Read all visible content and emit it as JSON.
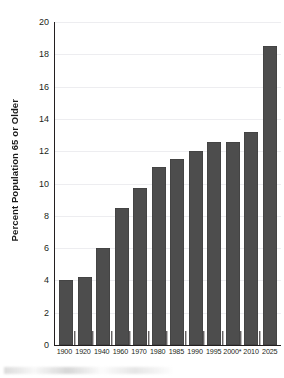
{
  "chart_data": {
    "type": "bar",
    "title": "",
    "xlabel": "",
    "ylabel": "Percent Population 65 or Older",
    "ylim": [
      0,
      20
    ],
    "y_ticks": [
      0,
      2,
      4,
      6,
      8,
      10,
      12,
      14,
      16,
      18,
      20
    ],
    "y_tick_labels": [
      "0",
      "2",
      "4",
      "6",
      "8",
      "10",
      "12",
      "14",
      "16",
      "18",
      "20"
    ],
    "grid": "horizontal",
    "legend": "none",
    "bar_color": "#4d4d4d",
    "axis_color": "#231f20",
    "categories": [
      "1900",
      "1920",
      "1940",
      "1960",
      "1970",
      "1980",
      "1985",
      "1990",
      "1995",
      "2000*",
      "2010",
      "2025"
    ],
    "values": [
      4.0,
      4.2,
      6.0,
      8.5,
      9.7,
      11.0,
      11.5,
      12.0,
      12.6,
      12.6,
      13.2,
      18.5
    ],
    "annotations": [
      "* projected"
    ]
  },
  "axes": {
    "y_title": "Percent Population 65 or Older"
  }
}
